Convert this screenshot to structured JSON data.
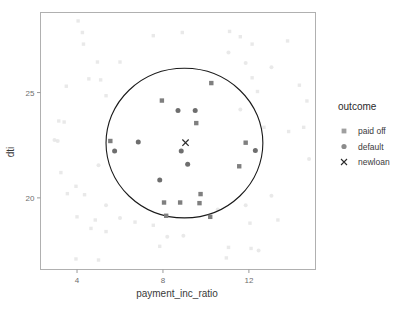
{
  "chart_data": {
    "type": "scatter",
    "title": "",
    "xlabel": "payment_inc_ratio",
    "ylabel": "dti",
    "xticks": [
      4,
      8,
      12
    ],
    "yticks": [
      25,
      20
    ],
    "xlim": [
      2.3,
      15.1
    ],
    "ylim": [
      16.6,
      28.8
    ],
    "grid": false,
    "legend": {
      "title": "outcome",
      "position": "right",
      "entries": [
        {
          "label": "paid off",
          "marker": "square",
          "color": "#7f7f7f"
        },
        {
          "label": "default",
          "marker": "circle",
          "color": "#6e6e6e"
        },
        {
          "label": "newloan",
          "marker": "x",
          "color": "#2b2b2b"
        }
      ]
    },
    "annotations": [
      {
        "type": "circle",
        "name": "knn-neighborhood-circle",
        "center_x": 9.0,
        "center_y": 22.6,
        "radius_x": 3.65,
        "radius_y": 3.55,
        "stroke": "#1a1a1a"
      }
    ],
    "series": [
      {
        "name": "newloan",
        "marker": "x",
        "color": "#2b2b2b",
        "points": [
          [
            9.05,
            22.62
          ]
        ]
      },
      {
        "name": "paid off (in neighborhood)",
        "marker": "square",
        "color": "#7f7f7f",
        "opacity": 1,
        "points": [
          [
            7.95,
            24.62
          ],
          [
            10.25,
            25.45
          ],
          [
            9.55,
            23.55
          ],
          [
            5.55,
            22.7
          ],
          [
            11.85,
            22.62
          ],
          [
            11.55,
            21.5
          ],
          [
            9.75,
            20.18
          ],
          [
            8.05,
            19.78
          ],
          [
            8.8,
            19.78
          ],
          [
            9.7,
            19.75
          ],
          [
            8.15,
            19.15
          ],
          [
            10.2,
            19.1
          ]
        ]
      },
      {
        "name": "default (in neighborhood)",
        "marker": "circle",
        "color": "#6e6e6e",
        "opacity": 1,
        "points": [
          [
            8.7,
            24.15
          ],
          [
            9.5,
            24.15
          ],
          [
            6.85,
            22.65
          ],
          [
            5.75,
            22.22
          ],
          [
            8.85,
            22.22
          ],
          [
            12.3,
            22.25
          ],
          [
            9.15,
            21.6
          ],
          [
            7.85,
            20.85
          ]
        ]
      },
      {
        "name": "paid off (outside)",
        "marker": "square",
        "color": "#cfcfcf",
        "opacity": 0.45,
        "points": [
          [
            4.05,
            28.4
          ],
          [
            4.25,
            27.85
          ],
          [
            4.3,
            27.3
          ],
          [
            7.55,
            27.7
          ],
          [
            8.9,
            27.85
          ],
          [
            11.1,
            27.9
          ],
          [
            11.6,
            27.65
          ],
          [
            12.15,
            27.3
          ],
          [
            13.8,
            27.45
          ],
          [
            4.95,
            26.45
          ],
          [
            6.0,
            26.45
          ],
          [
            4.55,
            25.65
          ],
          [
            5.1,
            25.6
          ],
          [
            3.5,
            25.3
          ],
          [
            5.35,
            24.85
          ],
          [
            14.35,
            25.35
          ],
          [
            12.4,
            25.05
          ],
          [
            12.15,
            25.7
          ],
          [
            14.7,
            24.6
          ],
          [
            3.15,
            23.65
          ],
          [
            3.4,
            23.6
          ],
          [
            14.55,
            23.35
          ],
          [
            12.7,
            23.35
          ],
          [
            13.85,
            23.15
          ],
          [
            3.25,
            21.2
          ],
          [
            3.95,
            20.55
          ],
          [
            3.55,
            20.2
          ],
          [
            4.35,
            20.15
          ],
          [
            4.0,
            19.1
          ],
          [
            4.85,
            18.95
          ],
          [
            6.7,
            18.85
          ],
          [
            7.55,
            18.7
          ],
          [
            4.65,
            18.55
          ],
          [
            5.35,
            18.4
          ],
          [
            12.05,
            18.8
          ],
          [
            13.35,
            18.95
          ],
          [
            11.05,
            17.65
          ],
          [
            12.1,
            17.6
          ],
          [
            3.95,
            17.1
          ],
          [
            5.0,
            17.05
          ],
          [
            7.85,
            17.7
          ],
          [
            10.95,
            17.15
          ]
        ]
      },
      {
        "name": "default (outside)",
        "marker": "circle",
        "color": "#cfcfcf",
        "opacity": 0.45,
        "points": [
          [
            11.05,
            26.9
          ],
          [
            11.85,
            26.4
          ],
          [
            13.05,
            26.2
          ],
          [
            11.6,
            24.2
          ],
          [
            2.95,
            22.75
          ],
          [
            3.1,
            22.7
          ],
          [
            5.0,
            21.55
          ],
          [
            14.8,
            21.85
          ],
          [
            13.05,
            20.1
          ],
          [
            5.35,
            19.65
          ],
          [
            6.0,
            19.05
          ],
          [
            10.55,
            19.45
          ],
          [
            11.85,
            19.65
          ],
          [
            8.2,
            18.15
          ],
          [
            8.95,
            18.2
          ],
          [
            12.45,
            17.5
          ]
        ]
      }
    ]
  },
  "axes": {
    "x_title": "payment_inc_ratio",
    "y_title": "dti",
    "x_tick_labels": [
      "4",
      "8",
      "12"
    ],
    "y_tick_labels": [
      "25",
      "20"
    ]
  },
  "legend": {
    "title": "outcome",
    "items": [
      {
        "label": "paid off"
      },
      {
        "label": "default"
      },
      {
        "label": "newloan"
      }
    ]
  },
  "colors": {
    "panel_border": "#b0b0b0",
    "tick": "#9a9a9a",
    "tick_text": "#6e6e6e",
    "axis_title": "#3a3a3a",
    "marker_dark": "#7f7f7f",
    "marker_faded": "#cfcfcf",
    "circle_stroke": "#1a1a1a",
    "newloan": "#2b2b2b"
  }
}
